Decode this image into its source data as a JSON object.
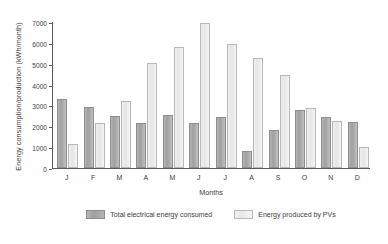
{
  "chart_data": {
    "type": "bar",
    "title": "",
    "xlabel": "Months",
    "ylabel": "Energy consumption/production (kWh/month)",
    "categories": [
      "J",
      "F",
      "M",
      "A",
      "M",
      "J",
      "J",
      "A",
      "S",
      "O",
      "N",
      "D"
    ],
    "series": [
      {
        "name": "Total electrical energy consumed",
        "color": "#a8a8a8",
        "values": [
          3300,
          2930,
          2470,
          2180,
          2560,
          2180,
          2450,
          800,
          1840,
          2790,
          2450,
          2210
        ]
      },
      {
        "name": "Energy produced by PVs",
        "color": "#ededed",
        "values": [
          1130,
          2170,
          3210,
          5020,
          5790,
          6940,
          5960,
          5290,
          4460,
          2890,
          2270,
          1010
        ]
      }
    ],
    "ylim": [
      0,
      7000
    ],
    "yticks": [
      0,
      1000,
      2000,
      3000,
      4000,
      5000,
      6000,
      7000
    ],
    "ytick_labels": [
      "0",
      "1000",
      "2000",
      "3000",
      "4000",
      "5000",
      "6000",
      "7000"
    ],
    "grid": false,
    "legend_position": "bottom"
  },
  "legend": {
    "items": [
      {
        "label": "Total electrical energy consumed"
      },
      {
        "label": "Energy produced by PVs"
      }
    ]
  }
}
